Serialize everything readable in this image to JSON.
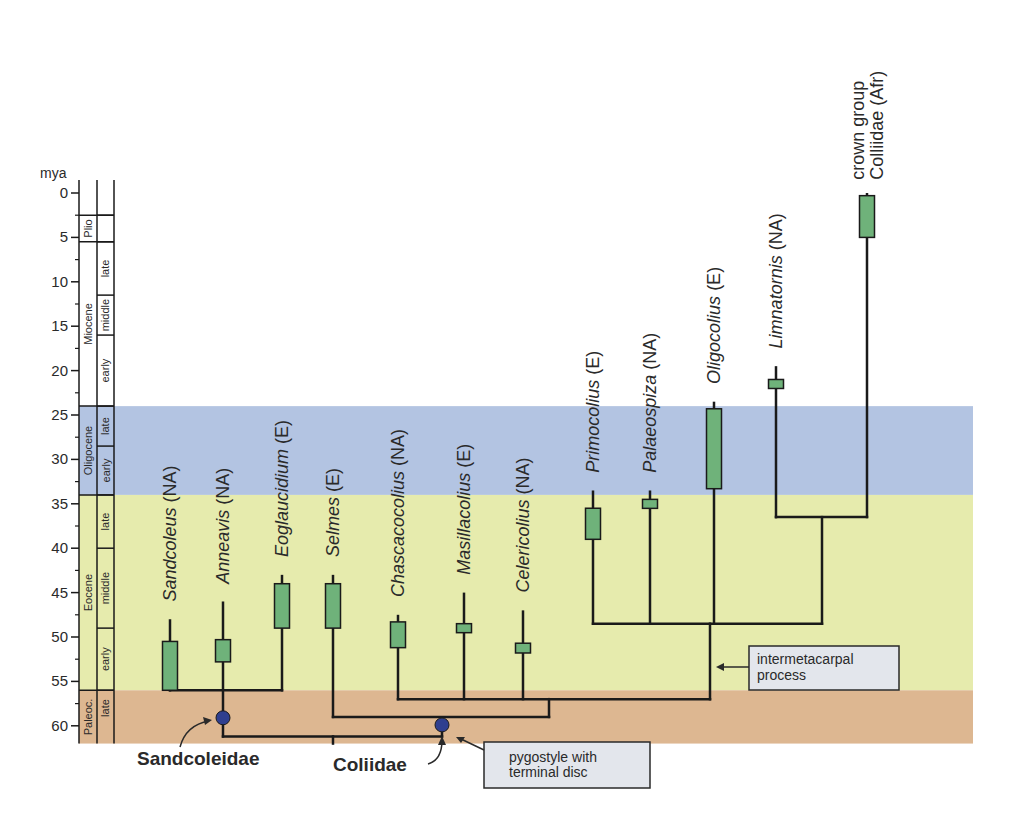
{
  "figure": {
    "axis": {
      "unit_label": "mya",
      "ticks": [
        0,
        5,
        10,
        15,
        20,
        25,
        30,
        35,
        40,
        45,
        50,
        55,
        60
      ]
    },
    "periods": [
      {
        "name": "Oligocene band",
        "from": 24,
        "to": 34,
        "color": "#b3c4e2"
      },
      {
        "name": "Eocene band",
        "from": 34,
        "to": 56,
        "color": "#e6ebad"
      },
      {
        "name": "Paleocene band",
        "from": 56,
        "to": 62,
        "color": "#ddb791"
      }
    ],
    "epochs": [
      {
        "label": "Plio",
        "from": 2.5,
        "to": 5.5
      },
      {
        "label": "Miocene",
        "from": 5.5,
        "to": 24
      },
      {
        "label": "Oligocene",
        "from": 24,
        "to": 34
      },
      {
        "label": "Eocene",
        "from": 34,
        "to": 56
      },
      {
        "label": "Paleoc.",
        "from": 56,
        "to": 62
      }
    ],
    "subepochs": [
      {
        "label": "",
        "from": 2.5,
        "to": 5.5
      },
      {
        "label": "late",
        "from": 5.5,
        "to": 11.5
      },
      {
        "label": "middle",
        "from": 11.5,
        "to": 16
      },
      {
        "label": "early",
        "from": 16,
        "to": 24
      },
      {
        "label": "late",
        "from": 24,
        "to": 28.5
      },
      {
        "label": "early",
        "from": 28.5,
        "to": 34
      },
      {
        "label": "late",
        "from": 34,
        "to": 40
      },
      {
        "label": "middle",
        "from": 40,
        "to": 49
      },
      {
        "label": "early",
        "from": 49,
        "to": 56
      },
      {
        "label": "late",
        "from": 56,
        "to": 60
      }
    ],
    "taxa": [
      {
        "name": "Sandcoleus",
        "region": "(NA)",
        "x": 170,
        "bar_from": 50.5,
        "bar_to": 56,
        "line_top": 48,
        "label_base": 46
      },
      {
        "name": "Anneavis",
        "region": "(NA)",
        "x": 223,
        "bar_from": 50.3,
        "bar_to": 52.8,
        "line_top": 46,
        "label_base": 44
      },
      {
        "name": "Eoglaucidium",
        "region": "(E)",
        "x": 282,
        "bar_from": 44,
        "bar_to": 49,
        "line_top": 43,
        "label_base": 41
      },
      {
        "name": "Selmes",
        "region": "(E)",
        "x": 333,
        "bar_from": 44,
        "bar_to": 49,
        "line_top": 43,
        "label_base": 41
      },
      {
        "name": "Chascacocolius",
        "region": "(NA)",
        "x": 398,
        "bar_from": 48.3,
        "bar_to": 51.2,
        "line_top": 47.5,
        "label_base": 45.5
      },
      {
        "name": "Masillacolius",
        "region": "(E)",
        "x": 464,
        "bar_from": 48.5,
        "bar_to": 49.5,
        "line_top": 45,
        "label_base": 43
      },
      {
        "name": "Celericolius",
        "region": "(NA)",
        "x": 523,
        "bar_from": 50.7,
        "bar_to": 51.8,
        "line_top": 47,
        "label_base": 45
      },
      {
        "name": "Primocolius",
        "region": "(E)",
        "x": 593,
        "bar_from": 35.5,
        "bar_to": 39,
        "line_top": 33.5,
        "label_base": 31.5
      },
      {
        "name": "Palaeospiza",
        "region": "(NA)",
        "x": 650,
        "bar_from": 34.5,
        "bar_to": 35.5,
        "line_top": 33.5,
        "label_base": 31.5
      },
      {
        "name": "Oligocolius",
        "region": "(E)",
        "x": 714,
        "bar_from": 24.3,
        "bar_to": 33.3,
        "line_top": 23.5,
        "label_base": 21.5
      },
      {
        "name": "Limnatornis",
        "region": "(NA)",
        "x": 776,
        "bar_from": 21,
        "bar_to": 22,
        "line_top": 19.5,
        "label_base": 17.5
      }
    ],
    "crown": {
      "line1": "crown group",
      "line2": "Colliidae (Afr)",
      "x": 867,
      "bar_from": 0.3,
      "bar_to": 5,
      "line_top": 0
    },
    "clades": {
      "sandcoleidae": "Sandcoleidae",
      "coliidae": "Coliidae"
    },
    "callouts": {
      "intermetacarpal_1": "intermetacarpal",
      "intermetacarpal_2": "process",
      "pygostyle_1": "pygostyle with",
      "pygostyle_2": "terminal disc"
    },
    "colors": {
      "bar_fill": "#6fb27a",
      "node_fill": "#2f3f8f",
      "callout_fill": "#e3e6ec",
      "line": "#1a1a1a"
    }
  }
}
